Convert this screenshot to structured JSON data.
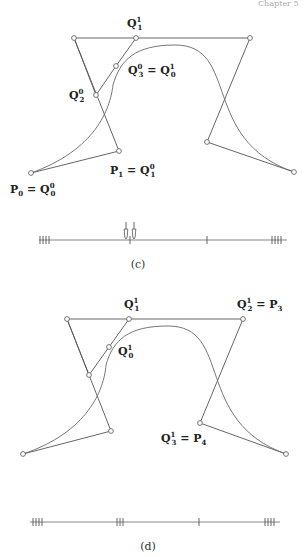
{
  "header_fragment": "Chapter 5",
  "figures": [
    {
      "id": "c",
      "caption": "(c)",
      "control_polygon": [
        [
          31,
          173
        ],
        [
          119,
          151
        ],
        [
          74,
          38
        ],
        [
          250,
          38
        ],
        [
          207,
          142
        ],
        [
          294,
          172
        ]
      ],
      "refined_polygon": [
        [
          74,
          38
        ],
        [
          96,
          95
        ],
        [
          116,
          66
        ],
        [
          136,
          38
        ]
      ],
      "curve_path": "M31,173 C95,150 110,110 113,85 C120,60 135,45 175,45 C240,45 200,140 294,172",
      "points": [
        [
          31,
          173
        ],
        [
          119,
          151
        ],
        [
          74,
          38
        ],
        [
          250,
          38
        ],
        [
          207,
          142
        ],
        [
          294,
          172
        ],
        [
          96,
          95
        ],
        [
          116,
          66
        ],
        [
          136,
          38
        ]
      ],
      "labels": [
        {
          "base": "Q",
          "sup": "1",
          "sub": "1",
          "x": 127,
          "y": 27
        },
        {
          "base": "Q",
          "sup": "0",
          "sub": "3",
          "eq": "= Q",
          "eq_sup": "1",
          "eq_sub": "0",
          "x": 128,
          "y": 74
        },
        {
          "base": "Q",
          "sup": "0",
          "sub": "2",
          "x": 69,
          "y": 99
        },
        {
          "base": "P",
          "sub": "1",
          "eq": "= Q",
          "eq_sup": "0",
          "eq_sub": "1",
          "x": 110,
          "y": 174
        },
        {
          "base": "P",
          "sub": "0",
          "eq": "= Q",
          "eq_sup": "0",
          "eq_sub": "0",
          "x": 10,
          "y": 193
        }
      ],
      "knot_line": {
        "y": 240,
        "x1": 39,
        "x2": 287,
        "ticks": [
          40,
          43,
          46,
          49,
          130,
          207,
          272,
          275,
          278,
          281
        ],
        "arrows": [
          126,
          134
        ]
      }
    },
    {
      "id": "d",
      "caption": "(d)",
      "control_polygon": [
        [
          23,
          454
        ],
        [
          111,
          431
        ],
        [
          67,
          319
        ],
        [
          243,
          319
        ],
        [
          200,
          423
        ],
        [
          286,
          454
        ]
      ],
      "refined_polygon": [
        [
          67,
          319
        ],
        [
          89,
          375
        ],
        [
          109,
          347
        ],
        [
          129,
          319
        ]
      ],
      "curve_path": "M23,454 C88,432 104,390 106,365 C113,340 128,326 168,326 C233,326 193,421 286,454",
      "points": [
        [
          23,
          454
        ],
        [
          111,
          431
        ],
        [
          67,
          319
        ],
        [
          243,
          319
        ],
        [
          200,
          423
        ],
        [
          286,
          454
        ],
        [
          89,
          375
        ],
        [
          109,
          347
        ],
        [
          129,
          319
        ]
      ],
      "labels": [
        {
          "base": "Q",
          "sup": "1",
          "sub": "1",
          "x": 124,
          "y": 308
        },
        {
          "base": "Q",
          "sup": "1",
          "sub": "2",
          "eq": "= P",
          "eq_sub": "3",
          "x": 237,
          "y": 308
        },
        {
          "base": "Q",
          "sup": "1",
          "sub": "0",
          "x": 118,
          "y": 355
        },
        {
          "base": "Q",
          "sup": "1",
          "sub": "3",
          "eq": "= P",
          "eq_sub": "4",
          "x": 161,
          "y": 442
        }
      ],
      "knot_line": {
        "y": 522,
        "x1": 30,
        "x2": 280,
        "ticks": [
          33,
          36,
          39,
          42,
          117,
          120,
          123,
          199,
          265,
          268,
          271,
          274
        ],
        "arrows": []
      }
    }
  ],
  "captions": {
    "c": "(c)",
    "d": "(d)"
  }
}
